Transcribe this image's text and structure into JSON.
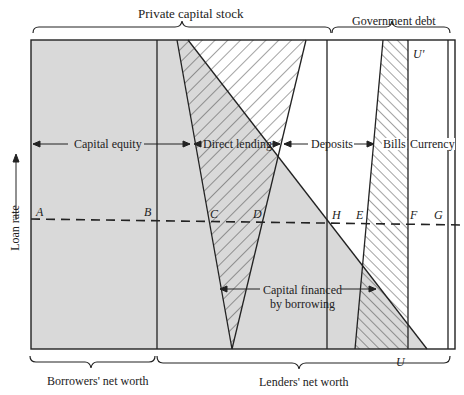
{
  "figure": {
    "title_top_left": "Private capital stock",
    "title_top_right": "Government debt",
    "axis_label": "Loan rate",
    "bottom_left": "Borrowers' net worth",
    "bottom_right": "Lenders' net worth",
    "segments": {
      "capital_equity": "Capital equity",
      "direct_lending": "Direct lending",
      "deposits": "Deposits",
      "bills": "Bills",
      "currency": "Currency"
    },
    "annotation": {
      "line1": "Capital financed",
      "line2": "by borrowing"
    },
    "points": {
      "A": "A",
      "B": "B",
      "C": "C",
      "D": "D",
      "H": "H",
      "E": "E",
      "F": "F",
      "G": "G",
      "U": "U",
      "U_prime": "U'"
    },
    "colors": {
      "shade": "#d9d9d9",
      "line": "#222222",
      "background": "#ffffff"
    }
  }
}
